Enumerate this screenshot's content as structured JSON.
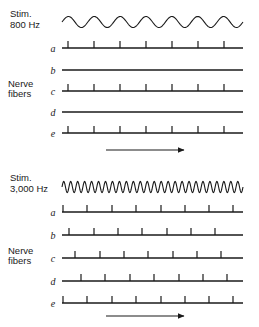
{
  "figure": {
    "type": "scientific-diagram",
    "background_color": "#ffffff",
    "ink_color": "#1a1a1a",
    "width": 259,
    "height": 327
  },
  "panels": [
    {
      "id": "panel-800",
      "stimulus": {
        "label_line1": "Stim.",
        "label_line2": "800 Hz",
        "waveform": {
          "kind": "sine",
          "cycles": 7,
          "amplitude_px": 5.5,
          "x_start": 62,
          "x_end": 243,
          "baseline_y": 22
        }
      },
      "group_label_line1": "Nerve",
      "group_label_line2": "fibers",
      "group_label_aligned_to": "c",
      "fibers": [
        {
          "letter": "a",
          "baseline_y": 48,
          "spike_count": 7,
          "spike_positions": [
            68,
            94,
            120,
            146,
            172,
            198,
            224
          ]
        },
        {
          "letter": "b",
          "baseline_y": 70,
          "spike_count": 0,
          "spike_positions": []
        },
        {
          "letter": "c",
          "baseline_y": 91,
          "spike_count": 7,
          "spike_positions": [
            68,
            94,
            120,
            146,
            172,
            198,
            224
          ]
        },
        {
          "letter": "d",
          "baseline_y": 112,
          "spike_count": 0,
          "spike_positions": []
        },
        {
          "letter": "e",
          "baseline_y": 133,
          "spike_count": 7,
          "spike_positions": [
            68,
            94,
            120,
            146,
            172,
            198,
            224
          ]
        }
      ],
      "time_arrow": {
        "direction": "right",
        "x_start": 106,
        "x_end": 186,
        "y": 150
      }
    },
    {
      "id": "panel-3000",
      "stimulus": {
        "label_line1": "Stim.",
        "label_line2": "3,000 Hz",
        "waveform": {
          "kind": "sine",
          "cycles": 26,
          "amplitude_px": 5.5,
          "x_start": 62,
          "x_end": 243,
          "baseline_y": 187
        }
      },
      "group_label_line1": "Nerve",
      "group_label_line2": "fibers",
      "group_label_aligned_to": "c",
      "fibers": [
        {
          "letter": "a",
          "baseline_y": 212,
          "spike_count": 8,
          "spike_positions": [
            63,
            87,
            112,
            136,
            161,
            185,
            209,
            233
          ]
        },
        {
          "letter": "b",
          "baseline_y": 235,
          "spike_count": 7,
          "spike_positions": [
            69,
            94,
            118,
            142,
            167,
            191,
            215
          ]
        },
        {
          "letter": "c",
          "baseline_y": 258,
          "spike_count": 7,
          "spike_positions": [
            75,
            100,
            124,
            148,
            173,
            197,
            221
          ]
        },
        {
          "letter": "d",
          "baseline_y": 281,
          "spike_count": 7,
          "spike_positions": [
            81,
            105,
            130,
            154,
            179,
            203,
            227
          ]
        },
        {
          "letter": "e",
          "baseline_y": 303,
          "spike_count": 8,
          "spike_positions": [
            63,
            87,
            112,
            136,
            161,
            185,
            209,
            233
          ]
        }
      ],
      "time_arrow": {
        "direction": "right",
        "x_start": 106,
        "x_end": 186,
        "y": 316
      }
    }
  ],
  "geometry": {
    "trace_x_start": 62,
    "trace_x_end": 243,
    "letter_x": 53,
    "stim_label_x": 10,
    "group_label_x": 8,
    "spike_height": 7,
    "line_width": 1.1
  }
}
